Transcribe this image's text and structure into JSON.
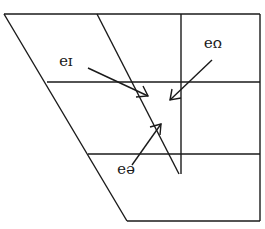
{
  "diagram": {
    "type": "vowel-quadrilateral-diphthongs",
    "orientation": "rotated-180",
    "labels": [
      {
        "id": "ia",
        "text": "ɪə",
        "x": 66,
        "y": 70
      },
      {
        "id": "ua",
        "text": "ʊə",
        "x": 213,
        "y": 52
      },
      {
        "id": "ea",
        "text": "eə",
        "x": 126,
        "y": 178
      }
    ],
    "colors": {
      "line": "#1a1a1a",
      "background": "#ffffff"
    }
  }
}
